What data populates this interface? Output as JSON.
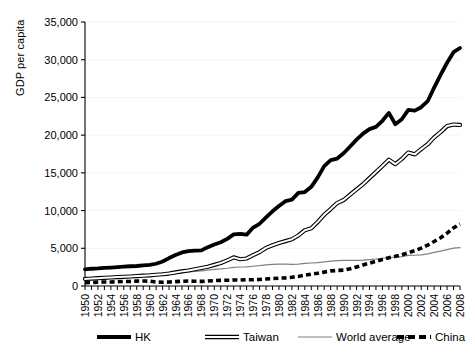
{
  "chart_data": {
    "type": "line",
    "title": "",
    "xlabel": "",
    "ylabel": "GDP per capita",
    "xlim": [
      1950,
      2008
    ],
    "ylim": [
      0,
      35000
    ],
    "ytick_step": 5000,
    "xtick_step": 2,
    "grid": true,
    "legend_position": "bottom",
    "ytick_labels": [
      "0",
      "5,000",
      "10,000",
      "15,000",
      "20,000",
      "25,000",
      "30,000",
      "35,000"
    ],
    "ytick_values": [
      0,
      5000,
      10000,
      15000,
      20000,
      25000,
      30000,
      35000
    ],
    "xtick_labels": [
      "1950",
      "1952",
      "1954",
      "1956",
      "1958",
      "1960",
      "1962",
      "1964",
      "1966",
      "1968",
      "1970",
      "1972",
      "1974",
      "1976",
      "1978",
      "1980",
      "1982",
      "1984",
      "1986",
      "1988",
      "1990",
      "1992",
      "1994",
      "1996",
      "1998",
      "2000",
      "2002",
      "2004",
      "2006",
      "2008"
    ],
    "x": [
      1950,
      1951,
      1952,
      1953,
      1954,
      1955,
      1956,
      1957,
      1958,
      1959,
      1960,
      1961,
      1962,
      1963,
      1964,
      1965,
      1966,
      1967,
      1968,
      1969,
      1970,
      1971,
      1972,
      1973,
      1974,
      1975,
      1976,
      1977,
      1978,
      1979,
      1980,
      1981,
      1982,
      1983,
      1984,
      1985,
      1986,
      1987,
      1988,
      1989,
      1990,
      1991,
      1992,
      1993,
      1994,
      1995,
      1996,
      1997,
      1998,
      1999,
      2000,
      2001,
      2002,
      2003,
      2004,
      2005,
      2006,
      2007,
      2008
    ],
    "series": [
      {
        "name": "HK",
        "style": "thick-solid",
        "color": "#000000",
        "values": [
          2218,
          2290,
          2330,
          2390,
          2440,
          2500,
          2560,
          2620,
          2650,
          2720,
          2800,
          2950,
          3250,
          3700,
          4100,
          4450,
          4620,
          4700,
          4720,
          5150,
          5500,
          5800,
          6250,
          6850,
          6900,
          6800,
          7750,
          8250,
          9100,
          9900,
          10600,
          11250,
          11450,
          12350,
          12450,
          13150,
          14400,
          15900,
          16700,
          16900,
          17600,
          18500,
          19400,
          20200,
          20800,
          21100,
          21900,
          22950,
          21450,
          22100,
          23350,
          23250,
          23700,
          24500,
          26300,
          28000,
          29600,
          31000,
          31550
        ]
      },
      {
        "name": "Taiwan",
        "style": "double-solid",
        "color": "#000000",
        "values": [
          940,
          980,
          1040,
          1090,
          1130,
          1180,
          1210,
          1260,
          1310,
          1370,
          1420,
          1490,
          1560,
          1650,
          1800,
          1940,
          2060,
          2220,
          2380,
          2550,
          2800,
          3050,
          3400,
          3800,
          3550,
          3650,
          4100,
          4500,
          5050,
          5400,
          5700,
          5950,
          6200,
          6700,
          7400,
          7650,
          8500,
          9450,
          10200,
          11000,
          11400,
          12100,
          12800,
          13500,
          14300,
          15100,
          15900,
          16750,
          16150,
          16850,
          17700,
          17450,
          18150,
          18800,
          19700,
          20400,
          21200,
          21400,
          21350
        ]
      },
      {
        "name": "World average",
        "style": "thin-solid",
        "color": "#808080",
        "values": [
          1000,
          1050,
          1080,
          1130,
          1160,
          1210,
          1260,
          1300,
          1330,
          1390,
          1450,
          1490,
          1560,
          1630,
          1720,
          1790,
          1870,
          1920,
          2010,
          2110,
          2200,
          2260,
          2350,
          2480,
          2520,
          2530,
          2620,
          2690,
          2790,
          2870,
          2900,
          2900,
          2880,
          2910,
          3000,
          3050,
          3110,
          3190,
          3300,
          3370,
          3400,
          3390,
          3400,
          3420,
          3500,
          3580,
          3680,
          3780,
          3820,
          3900,
          4050,
          4080,
          4130,
          4250,
          4450,
          4620,
          4830,
          5020,
          5100
        ]
      },
      {
        "name": "China",
        "style": "thick-dashed",
        "color": "#000000",
        "values": [
          448,
          460,
          510,
          530,
          540,
          560,
          600,
          610,
          650,
          660,
          640,
          520,
          500,
          530,
          580,
          630,
          660,
          630,
          610,
          660,
          720,
          750,
          760,
          800,
          800,
          840,
          820,
          860,
          930,
          980,
          1040,
          1080,
          1160,
          1270,
          1430,
          1580,
          1680,
          1840,
          2000,
          2060,
          2100,
          2280,
          2520,
          2780,
          3030,
          3280,
          3520,
          3740,
          3930,
          4140,
          4400,
          4680,
          5020,
          5420,
          5900,
          6400,
          7000,
          7700,
          8200
        ]
      }
    ]
  },
  "legend": {
    "items": [
      {
        "label": "HK",
        "style": "thick-solid"
      },
      {
        "label": "Taiwan",
        "style": "double-solid"
      },
      {
        "label": "World average",
        "style": "thin-solid"
      },
      {
        "label": "China",
        "style": "thick-dashed"
      }
    ]
  }
}
